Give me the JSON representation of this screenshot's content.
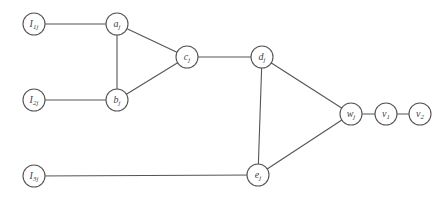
{
  "diagram": {
    "type": "graph",
    "nodes": [
      {
        "id": "I1j",
        "label": "I",
        "sub": "1j"
      },
      {
        "id": "aj",
        "label": "a",
        "sub": "j"
      },
      {
        "id": "bj",
        "label": "b",
        "sub": "j"
      },
      {
        "id": "I2j",
        "label": "I",
        "sub": "2j"
      },
      {
        "id": "cj",
        "label": "c",
        "sub": "j"
      },
      {
        "id": "dj",
        "label": "d",
        "sub": "j"
      },
      {
        "id": "ej",
        "label": "e",
        "sub": "j"
      },
      {
        "id": "I3j",
        "label": "I",
        "sub": "3j"
      },
      {
        "id": "wj",
        "label": "w",
        "sub": "j"
      },
      {
        "id": "v1",
        "label": "v",
        "sub": "1"
      },
      {
        "id": "v2",
        "label": "v",
        "sub": "2"
      }
    ],
    "edges": [
      [
        "I1j",
        "aj"
      ],
      [
        "aj",
        "bj"
      ],
      [
        "aj",
        "cj"
      ],
      [
        "I2j",
        "bj"
      ],
      [
        "bj",
        "cj"
      ],
      [
        "cj",
        "dj"
      ],
      [
        "dj",
        "ej"
      ],
      [
        "dj",
        "wj"
      ],
      [
        "ej",
        "wj"
      ],
      [
        "I3j",
        "ej"
      ],
      [
        "wj",
        "v1"
      ],
      [
        "v1",
        "v2"
      ]
    ],
    "colors": {
      "stroke": "#555555",
      "text": "#444444",
      "fill": "#ffffff"
    }
  }
}
